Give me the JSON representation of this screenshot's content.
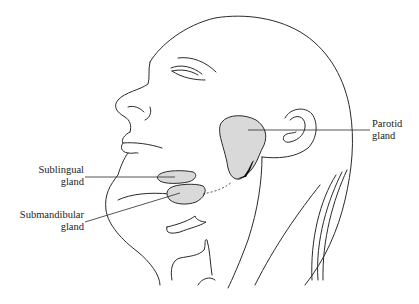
{
  "diagram": {
    "title": "",
    "colors": {
      "outline": "#2a2a2a",
      "gland_fill": "#d9d9d9",
      "background": "#ffffff",
      "duct_dark": "#111111"
    },
    "labels": [
      {
        "id": "parotid",
        "line1": "Parotid",
        "line2": "gland"
      },
      {
        "id": "sublingual",
        "line1": "Sublingual",
        "line2": "gland"
      },
      {
        "id": "submandibular",
        "line1": "Submandibular",
        "line2": "gland"
      }
    ]
  }
}
